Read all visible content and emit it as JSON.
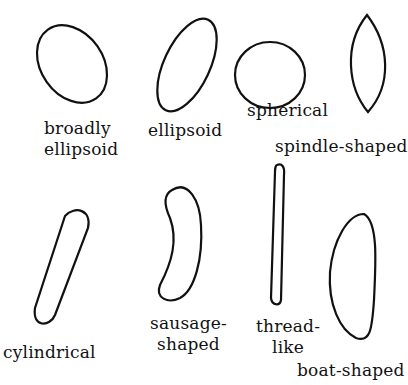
{
  "header": {
    "caption_fragment": ""
  },
  "shapes": [
    {
      "id": "broadly-ellipsoid",
      "label_lines": [
        "broadly",
        "ellipsoid"
      ]
    },
    {
      "id": "ellipsoid",
      "label_lines": [
        "ellipsoid"
      ]
    },
    {
      "id": "spherical",
      "label_lines": [
        "spherical"
      ]
    },
    {
      "id": "spindle-shaped",
      "label_lines": [
        "spindle-shaped"
      ]
    },
    {
      "id": "cylindrical",
      "label_lines": [
        "cylindrical"
      ]
    },
    {
      "id": "sausage-shaped",
      "label_lines": [
        "sausage-",
        "shaped"
      ]
    },
    {
      "id": "thread-like",
      "label_lines": [
        "thread-",
        "like"
      ]
    },
    {
      "id": "boat-shaped",
      "label_lines": [
        "boat-shaped"
      ]
    }
  ],
  "colors": {
    "stroke": "#111111",
    "background": "#ffffff"
  }
}
